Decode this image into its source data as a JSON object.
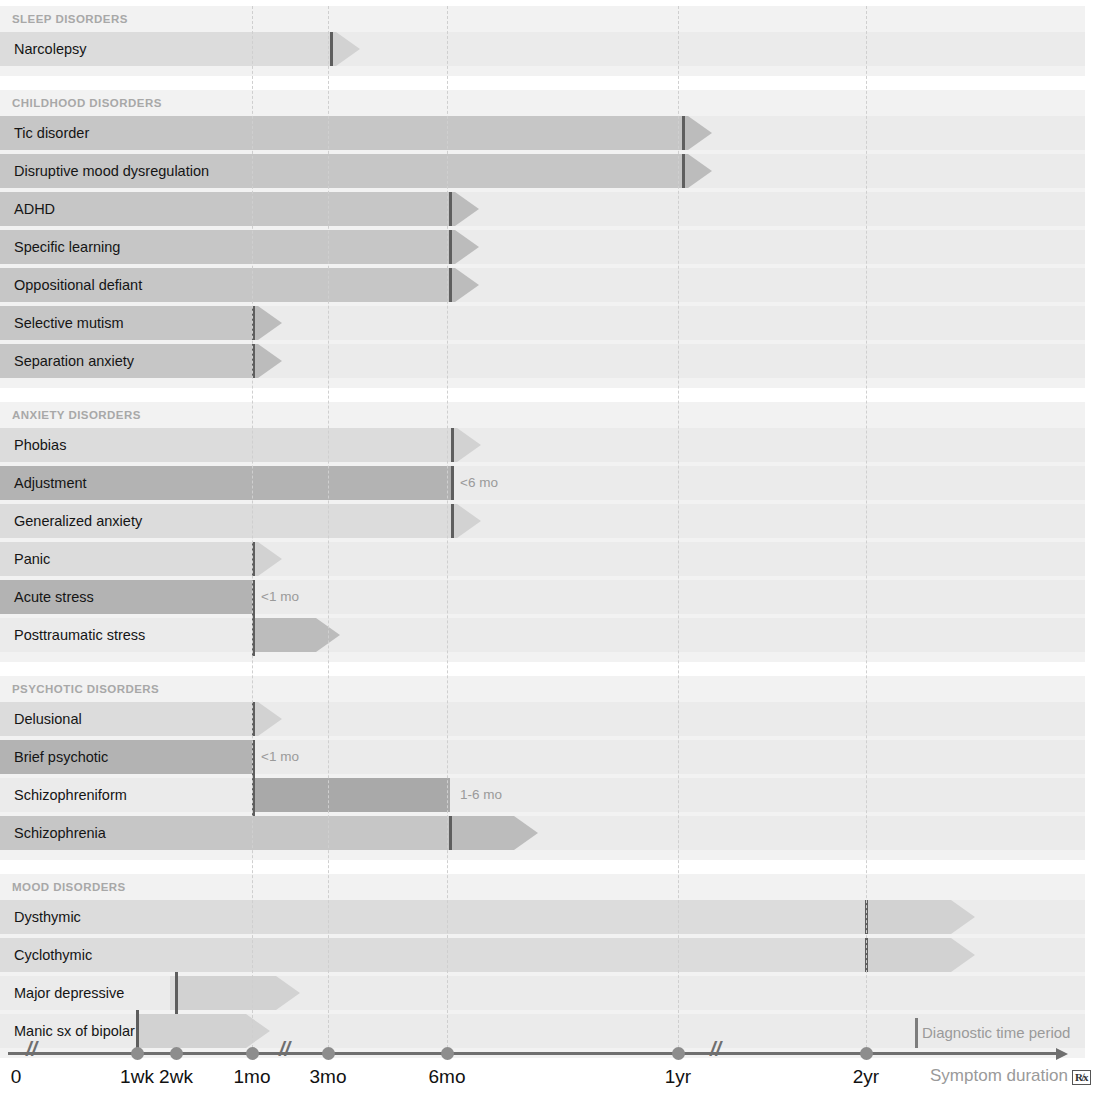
{
  "chart_data": {
    "type": "bar",
    "xlabel": "Symptom duration",
    "ylabel": "",
    "grid": true,
    "legend_position": "bottom-right",
    "axis": {
      "ticks": [
        {
          "label": "0",
          "x": 16
        },
        {
          "label": "1wk",
          "x": 137
        },
        {
          "label": "2wk",
          "x": 176
        },
        {
          "label": "1mo",
          "x": 252
        },
        {
          "label": "3mo",
          "x": 328
        },
        {
          "label": "6mo",
          "x": 447
        },
        {
          "label": "1yr",
          "x": 678
        },
        {
          "label": "2yr",
          "x": 866
        }
      ],
      "breaks": [
        {
          "x": 34
        },
        {
          "x": 287
        },
        {
          "x": 718
        }
      ],
      "gridlines": [
        252,
        328,
        447,
        678,
        866
      ]
    },
    "legend": {
      "diagnostic_marker_label": "Diagnostic time period",
      "axis_label": "Symptom duration",
      "rx_symbol": "R̸x"
    },
    "sections": [
      {
        "name": "SLEEP DISORDERS",
        "rows": [
          {
            "label": "Narcolepsy",
            "start": 0,
            "marker": 331,
            "head_end": 360,
            "tone": "light",
            "annotation": "",
            "open_start": false
          }
        ]
      },
      {
        "name": "CHILDHOOD DISORDERS",
        "rows": [
          {
            "label": "Tic disorder",
            "start": 0,
            "marker": 683,
            "head_end": 712,
            "tone": "mid",
            "annotation": "",
            "open_start": false
          },
          {
            "label": "Disruptive mood dysregulation",
            "start": 0,
            "marker": 683,
            "head_end": 712,
            "tone": "mid",
            "annotation": "",
            "open_start": false
          },
          {
            "label": "ADHD",
            "start": 0,
            "marker": 450,
            "head_end": 479,
            "tone": "mid",
            "annotation": "",
            "open_start": false
          },
          {
            "label": "Specific learning",
            "start": 0,
            "marker": 450,
            "head_end": 479,
            "tone": "mid",
            "annotation": "",
            "open_start": false
          },
          {
            "label": "Oppositional defiant",
            "start": 0,
            "marker": 450,
            "head_end": 479,
            "tone": "mid",
            "annotation": "",
            "open_start": false
          },
          {
            "label": "Selective mutism",
            "start": 0,
            "marker": 253,
            "head_end": 282,
            "tone": "mid",
            "annotation": "",
            "open_start": false
          },
          {
            "label": "Separation anxiety",
            "start": 0,
            "marker": 253,
            "head_end": 282,
            "tone": "mid",
            "annotation": "",
            "open_start": false
          }
        ]
      },
      {
        "name": "ANXIETY DISORDERS",
        "rows": [
          {
            "label": "Phobias",
            "start": 0,
            "marker": 452,
            "head_end": 481,
            "tone": "light",
            "annotation": "",
            "open_start": false
          },
          {
            "label": "Adjustment",
            "start": 0,
            "marker": 452,
            "head_end": 452,
            "tone": "dark",
            "annotation": "<6 mo",
            "annotation_x": 460,
            "open_start": false
          },
          {
            "label": "Generalized anxiety",
            "start": 0,
            "marker": 452,
            "head_end": 481,
            "tone": "light",
            "annotation": "",
            "open_start": false
          },
          {
            "label": "Panic",
            "start": 0,
            "marker": 253,
            "head_end": 282,
            "tone": "light",
            "annotation": "",
            "open_start": false
          },
          {
            "label": "Acute stress",
            "start": 0,
            "marker": 253,
            "head_end": 253,
            "tone": "dark",
            "annotation": "<1 mo",
            "annotation_x": 261,
            "open_start": false
          },
          {
            "label": "Posttraumatic stress",
            "start": 253,
            "marker": 253,
            "head_end": 340,
            "tone": "mid",
            "annotation": "",
            "open_start": true
          }
        ]
      },
      {
        "name": "PSYCHOTIC DISORDERS",
        "rows": [
          {
            "label": "Delusional",
            "start": 0,
            "marker": 253,
            "head_end": 282,
            "tone": "light",
            "annotation": "",
            "open_start": false
          },
          {
            "label": "Brief psychotic",
            "start": 0,
            "marker": 253,
            "head_end": 253,
            "tone": "dark",
            "annotation": "<1 mo",
            "annotation_x": 261,
            "open_start": false
          },
          {
            "label": "Schizophreniform",
            "start": 253,
            "marker": 253,
            "head_end": 450,
            "tone": "dark",
            "annotation": "1-6 mo",
            "annotation_x": 460,
            "open_start": true,
            "flat_end": true
          },
          {
            "label": "Schizophrenia",
            "start": 0,
            "marker": 450,
            "head_end": 538,
            "tone": "mid",
            "annotation": "",
            "open_start": false
          }
        ]
      },
      {
        "name": "MOOD DISORDERS",
        "rows": [
          {
            "label": "Dysthymic",
            "start": 0,
            "marker": 866,
            "head_end": 975,
            "tone": "light",
            "annotation": "",
            "open_start": false
          },
          {
            "label": "Cyclothymic",
            "start": 0,
            "marker": 866,
            "head_end": 975,
            "tone": "light",
            "annotation": "",
            "open_start": false
          },
          {
            "label": "Major depressive",
            "start": 170,
            "marker": 176,
            "head_end": 300,
            "tone": "light",
            "annotation": "",
            "open_start": true
          },
          {
            "label": "Manic sx of bipolar",
            "start": 140,
            "marker": 137,
            "head_end": 270,
            "tone": "light",
            "annotation": "",
            "open_start": true
          }
        ]
      }
    ],
    "tones": {
      "light": "#dcdcdc",
      "mid": "#c6c6c6",
      "dark": "#b3b3b3",
      "head_light": "#d2d2d2",
      "head_mid": "#bcbcbc",
      "head_dark": "#a9a9a9"
    }
  }
}
